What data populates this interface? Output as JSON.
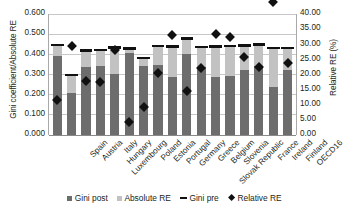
{
  "chart_data": {
    "type": "bar",
    "title": "",
    "subtitle": "",
    "xlabel": "",
    "ylabel": "Gini coefficient/Absolute RE",
    "y2label": "Relative RE (%)",
    "ylim": [
      0.0,
      0.6
    ],
    "y2lim": [
      0.0,
      40.0
    ],
    "grid": true,
    "legend_position": "bottom",
    "y_ticks": [
      "0.000",
      "0.100",
      "0.200",
      "0.300",
      "0.400",
      "0.500",
      "0.600"
    ],
    "y2_ticks": [
      "0.00",
      "5.00",
      "10.00",
      "15.00",
      "20.00",
      "25.00",
      "30.00",
      "35.00",
      "40.00"
    ],
    "categories": [
      "Spain",
      "Austria",
      "Italy",
      "Hungary",
      "Luxembourg",
      "Poland",
      "Estonia",
      "Portugal",
      "Germany",
      "Greece",
      "Belgium",
      "Slovenia",
      "Slovak Republic",
      "France",
      "Ireland",
      "Finland",
      "OECD16"
    ],
    "series": [
      {
        "name": "Gini post",
        "type": "bar-stacked",
        "color": "#6e6d6d",
        "axis": "left",
        "values": [
          0.388,
          0.205,
          0.337,
          0.342,
          0.301,
          0.404,
          0.341,
          0.345,
          0.287,
          0.401,
          0.334,
          0.287,
          0.292,
          0.322,
          0.341,
          0.235,
          0.322
        ]
      },
      {
        "name": "Absolute RE",
        "type": "bar-stacked",
        "color": "#c3c2c2",
        "axis": "left",
        "values": [
          0.055,
          0.091,
          0.079,
          0.078,
          0.131,
          0.023,
          0.039,
          0.094,
          0.149,
          0.075,
          0.1,
          0.15,
          0.146,
          0.118,
          0.104,
          0.193,
          0.107
        ]
      },
      {
        "name": "Gini pre",
        "type": "marker-line",
        "color": "#111111",
        "axis": "left",
        "values": [
          0.443,
          0.296,
          0.416,
          0.42,
          0.432,
          0.427,
          0.38,
          0.439,
          0.436,
          0.476,
          0.434,
          0.437,
          0.438,
          0.44,
          0.445,
          0.428,
          0.429
        ]
      },
      {
        "name": "Relative RE",
        "type": "scatter-diamond",
        "color": "#111111",
        "axis": "right",
        "values": [
          12.6,
          30.3,
          18.9,
          18.6,
          29.2,
          5.2,
          10.2,
          21.4,
          33.9,
          15.6,
          23.1,
          34.4,
          33.4,
          26.9,
          23.4,
          45.0,
          24.9
        ]
      }
    ],
    "legend": [
      {
        "label": "Gini post",
        "marker": "square",
        "color": "#6e6d6d"
      },
      {
        "label": "Absolute RE",
        "marker": "square",
        "color": "#c3c2c2"
      },
      {
        "label": "Gini pre",
        "marker": "line",
        "color": "#111111"
      },
      {
        "label": "Relative RE",
        "marker": "diamond",
        "color": "#111111"
      }
    ]
  }
}
